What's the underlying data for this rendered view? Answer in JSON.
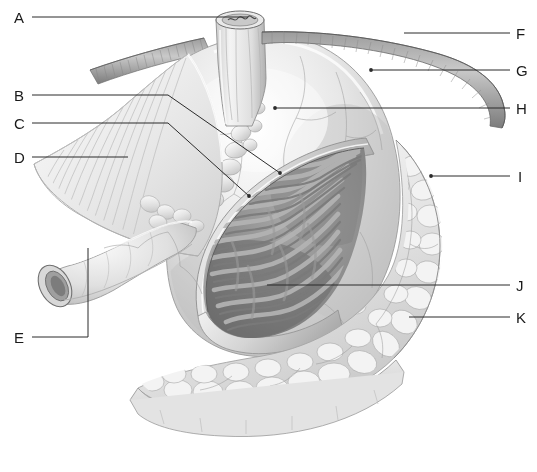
{
  "figure": {
    "style": "grayscale pencil-shaded medical illustration",
    "background_color": "#ffffff",
    "line_color": "#2b2b2b",
    "label_color": "#1a1a1a",
    "width": 537,
    "height": 472
  },
  "labels": [
    {
      "id": "A",
      "text": "A",
      "side": "left",
      "x": 14,
      "y": 10,
      "line": [
        [
          32,
          17
        ],
        [
          248,
          17
        ]
      ]
    },
    {
      "id": "B",
      "text": "B",
      "side": "left",
      "x": 14,
      "y": 88,
      "line": [
        [
          32,
          95
        ],
        [
          168,
          95
        ],
        [
          280,
          173
        ]
      ]
    },
    {
      "id": "C",
      "text": "C",
      "side": "left",
      "x": 14,
      "y": 116,
      "line": [
        [
          32,
          123
        ],
        [
          168,
          123
        ],
        [
          249,
          196
        ]
      ]
    },
    {
      "id": "D",
      "text": "D",
      "side": "left",
      "x": 14,
      "y": 150,
      "line": [
        [
          32,
          157
        ],
        [
          128,
          157
        ]
      ]
    },
    {
      "id": "E",
      "text": "E",
      "side": "left",
      "x": 14,
      "y": 330,
      "line": [
        [
          32,
          337
        ],
        [
          88,
          337
        ],
        [
          88,
          248
        ]
      ]
    },
    {
      "id": "F",
      "text": "F",
      "side": "right",
      "x": 516,
      "y": 26,
      "line": [
        [
          404,
          33
        ],
        [
          510,
          33
        ]
      ]
    },
    {
      "id": "G",
      "text": "G",
      "side": "right",
      "x": 516,
      "y": 63,
      "line": [
        [
          371,
          70
        ],
        [
          510,
          70
        ]
      ]
    },
    {
      "id": "H",
      "text": "H",
      "side": "right",
      "x": 516,
      "y": 101,
      "line": [
        [
          275,
          108
        ],
        [
          510,
          108
        ]
      ]
    },
    {
      "id": "I",
      "text": "I",
      "side": "right",
      "x": 518,
      "y": 169,
      "line": [
        [
          431,
          176
        ],
        [
          510,
          176
        ]
      ]
    },
    {
      "id": "J",
      "text": "J",
      "side": "right",
      "x": 516,
      "y": 278,
      "line": [
        [
          267,
          285
        ],
        [
          510,
          285
        ]
      ]
    },
    {
      "id": "K",
      "text": "K",
      "side": "right",
      "x": 516,
      "y": 310,
      "line": [
        [
          409,
          317
        ],
        [
          510,
          317
        ]
      ]
    }
  ],
  "illustration_parts": {
    "esophagus_stub": "cut esophagus at top center",
    "band_structure": "striated band passing horizontally behind esophagus",
    "fundus_body": "smooth shaded stomach body with fine vessels",
    "cut_interior": "dark interior showing rugae / mucosal folds",
    "omentum": "lobulated fatty tissue along greater curvature and base",
    "duodenum_stub": "cut duodenal tube at lower left"
  }
}
